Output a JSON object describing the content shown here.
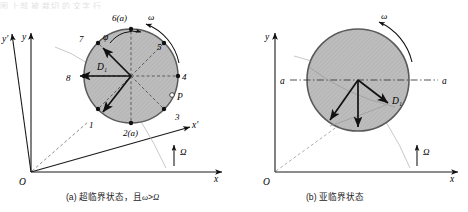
{
  "figure": {
    "top_faded_text": "图 上部 被 裁切 的 文字 行",
    "panels": [
      {
        "id": "a",
        "caption": "(a) 超临界状态，且ω>Ω",
        "caption_prefix": "(a)",
        "caption_text": "超临界状态，且",
        "caption_omega": "ω",
        "caption_gt": ">",
        "caption_Omega": "Ω",
        "axes": {
          "origin_label": "O",
          "x_label": "x",
          "y_label": "y",
          "x_prime_label": "x'",
          "y_prime_label": "y'",
          "spin_label": "Ω",
          "rotation_label": "ω"
        },
        "disc": {
          "center_label": "D₁",
          "angle_label": "φ",
          "point_P_label": "P",
          "node_labels": [
            "1",
            "2(a)",
            "3",
            "4",
            "5",
            "6(a)",
            "7",
            "8"
          ]
        }
      },
      {
        "id": "b",
        "caption": "(b) 亚临界状态",
        "caption_prefix": "(b)",
        "caption_text": "亚临界状态",
        "axes": {
          "origin_label": "O",
          "x_label": "x",
          "y_label": "y",
          "spin_label": "Ω",
          "rotation_label": "ω"
        },
        "disc": {
          "center_label": "D₁",
          "axis_left_label": "a",
          "axis_right_label": "a"
        }
      }
    ]
  },
  "colors": {
    "disc_fill": "#b8b8b8",
    "disc_stroke": "#5a5a5a",
    "line": "#1a1a1a",
    "dashed": "#3c3c3c",
    "faint": "#9a9a9a",
    "background": "#ffffff"
  }
}
